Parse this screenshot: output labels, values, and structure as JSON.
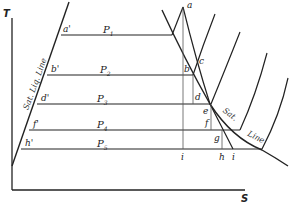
{
  "diagram": {
    "type": "T-S diagram (temperature-entropy) with saturation dome",
    "axes": {
      "y_label": "T",
      "x_label": "S"
    },
    "saturation_lines": {
      "liquid_label": "Sat. Liq. Line",
      "vapor_label_part1": "Sat.",
      "vapor_label_part2": "Line"
    },
    "pressure_lines": [
      {
        "name": "P",
        "sub": "1"
      },
      {
        "name": "P",
        "sub": "2"
      },
      {
        "name": "P",
        "sub": "3"
      },
      {
        "name": "P",
        "sub": "4"
      },
      {
        "name": "P",
        "sub": "5"
      }
    ],
    "liquid_points": [
      "a'",
      "b'",
      "d'",
      "f'",
      "h'"
    ],
    "points": {
      "a": "a",
      "b": "b",
      "c": "c",
      "d": "d",
      "e": "e",
      "f": "f",
      "g": "g",
      "h": "h",
      "i_left": "i",
      "i_right": "i"
    },
    "colors": {
      "line": "#222222",
      "thin_line": "#555555",
      "background": "#ffffff"
    }
  }
}
